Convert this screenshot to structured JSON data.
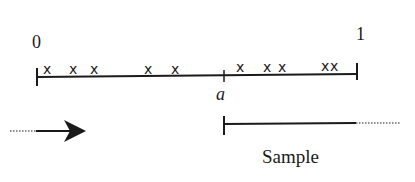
{
  "diagram": {
    "number_line": {
      "start_label": "0",
      "end_label": "1",
      "split_label": "a",
      "mark_glyph": "x",
      "marks_left_of_a": [
        "x",
        "x",
        "x",
        "x",
        "x"
      ],
      "marks_right_of_a": [
        "x",
        "x",
        "x",
        "x",
        "x"
      ]
    },
    "direction_arrow": {
      "icon": "arrow-right-icon"
    },
    "sample_segment": {
      "label": "Sample"
    },
    "colors": {
      "ink": "#1a1a1a",
      "background": "#ffffff"
    }
  }
}
